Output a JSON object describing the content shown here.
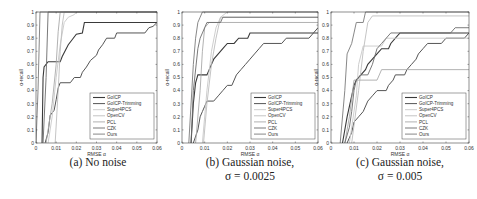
{
  "chart_data": [
    {
      "type": "line",
      "title": "(a) No noise",
      "caption_lines": [
        "(a) No noise"
      ],
      "xlabel": "RMSE α",
      "ylabel": "α-recall",
      "xlim": [
        0,
        0.06
      ],
      "ylim": [
        0,
        1
      ],
      "xticks": [
        "0",
        "0.01",
        "0.02",
        "0.03",
        "0.04",
        "0.05",
        "0.06"
      ],
      "yticks": [
        "0",
        "0.1",
        "0.2",
        "0.3",
        "0.4",
        "0.5",
        "0.6",
        "0.7",
        "0.8",
        "0.9",
        "1"
      ],
      "grid": false,
      "legend_position": "lower right",
      "series": [
        {
          "name": "GoICP",
          "color": "#3a3a3a",
          "width": 1.1,
          "points": [
            [
              0.003,
              0
            ],
            [
              0.0035,
              0.5
            ],
            [
              0.004,
              0.58
            ],
            [
              0.006,
              0.62
            ],
            [
              0.012,
              0.62
            ],
            [
              0.013,
              0.66
            ],
            [
              0.016,
              0.75
            ],
            [
              0.018,
              0.79
            ],
            [
              0.02,
              0.83
            ],
            [
              0.023,
              0.84
            ],
            [
              0.024,
              0.92
            ],
            [
              0.06,
              0.92
            ]
          ]
        },
        {
          "name": "GoICP-Trimming",
          "color": "#555555",
          "width": 1.0,
          "points": [
            [
              0.0045,
              0
            ],
            [
              0.006,
              0.08
            ],
            [
              0.007,
              0.21
            ],
            [
              0.009,
              0.25
            ],
            [
              0.01,
              0.33
            ],
            [
              0.011,
              0.42
            ],
            [
              0.012,
              0.46
            ],
            [
              0.017,
              0.46
            ],
            [
              0.019,
              0.5
            ],
            [
              0.022,
              0.5
            ],
            [
              0.023,
              0.54
            ],
            [
              0.025,
              0.58
            ],
            [
              0.027,
              0.63
            ],
            [
              0.03,
              0.67
            ],
            [
              0.031,
              0.71
            ],
            [
              0.033,
              0.75
            ],
            [
              0.035,
              0.8
            ],
            [
              0.039,
              0.8
            ],
            [
              0.04,
              0.84
            ],
            [
              0.054,
              0.84
            ],
            [
              0.056,
              0.88
            ],
            [
              0.058,
              0.89
            ],
            [
              0.06,
              0.92
            ]
          ]
        },
        {
          "name": "Super4PCS",
          "color": "#c8c8c8",
          "width": 0.9,
          "points": [
            [
              0.006,
              0
            ],
            [
              0.008,
              0.2
            ],
            [
              0.01,
              0.5
            ],
            [
              0.012,
              0.75
            ],
            [
              0.014,
              0.92
            ],
            [
              0.016,
              0.96
            ],
            [
              0.019,
              0.98
            ],
            [
              0.02,
              1
            ]
          ]
        },
        {
          "name": "OpenCV",
          "color": "#bdbdbd",
          "width": 0.9,
          "points": [
            [
              0.0095,
              0
            ],
            [
              0.011,
              0.4
            ],
            [
              0.012,
              0.7
            ],
            [
              0.013,
              0.9
            ],
            [
              0.014,
              1
            ]
          ]
        },
        {
          "name": "PCL",
          "color": "#a9a9a9",
          "width": 0.9,
          "points": [
            [
              0.005,
              0
            ],
            [
              0.008,
              0.3
            ],
            [
              0.01,
              0.6
            ],
            [
              0.011,
              0.85
            ],
            [
              0.012,
              1
            ]
          ]
        },
        {
          "name": "CZK",
          "color": "#6b6b6b",
          "width": 0.9,
          "points": [
            [
              0.0035,
              0
            ],
            [
              0.005,
              0.5
            ],
            [
              0.006,
              1
            ]
          ]
        },
        {
          "name": "Ours",
          "color": "#7a7a7a",
          "width": 0.9,
          "points": [
            [
              0,
              0
            ],
            [
              0.001,
              0.4
            ],
            [
              0.002,
              1
            ]
          ]
        }
      ]
    },
    {
      "type": "line",
      "title": "(b) Gaussian noise, σ = 0.0025",
      "caption_lines": [
        "(b) Gaussian noise,",
        "σ = 0.0025"
      ],
      "xlabel": "RMSE α",
      "ylabel": "α-recall",
      "xlim": [
        0,
        0.06
      ],
      "ylim": [
        0,
        1
      ],
      "xticks": [
        "0",
        "0.01",
        "0.02",
        "0.03",
        "0.04",
        "0.05",
        "0.06"
      ],
      "yticks": [
        "0",
        "0.1",
        "0.2",
        "0.3",
        "0.4",
        "0.5",
        "0.6",
        "0.7",
        "0.8",
        "0.9",
        "1"
      ],
      "grid": false,
      "legend_position": "lower right",
      "series": [
        {
          "name": "GoICP",
          "color": "#3a3a3a",
          "width": 1.1,
          "points": [
            [
              0.004,
              0
            ],
            [
              0.005,
              0.3
            ],
            [
              0.006,
              0.46
            ],
            [
              0.007,
              0.52
            ],
            [
              0.011,
              0.52
            ],
            [
              0.012,
              0.56
            ],
            [
              0.014,
              0.64
            ],
            [
              0.016,
              0.68
            ],
            [
              0.018,
              0.72
            ],
            [
              0.02,
              0.76
            ],
            [
              0.023,
              0.76
            ],
            [
              0.025,
              0.8
            ],
            [
              0.029,
              0.8
            ],
            [
              0.03,
              0.84
            ],
            [
              0.06,
              0.84
            ]
          ]
        },
        {
          "name": "GoICP-Trimming",
          "color": "#555555",
          "width": 1.0,
          "points": [
            [
              0.005,
              0
            ],
            [
              0.007,
              0.1
            ],
            [
              0.008,
              0.2
            ],
            [
              0.009,
              0.24
            ],
            [
              0.01,
              0.28
            ],
            [
              0.011,
              0.32
            ],
            [
              0.014,
              0.32
            ],
            [
              0.016,
              0.36
            ],
            [
              0.018,
              0.4
            ],
            [
              0.02,
              0.44
            ],
            [
              0.022,
              0.44
            ],
            [
              0.024,
              0.52
            ],
            [
              0.026,
              0.56
            ],
            [
              0.028,
              0.6
            ],
            [
              0.03,
              0.64
            ],
            [
              0.032,
              0.68
            ],
            [
              0.034,
              0.72
            ],
            [
              0.036,
              0.76
            ],
            [
              0.044,
              0.76
            ],
            [
              0.046,
              0.8
            ],
            [
              0.056,
              0.8
            ],
            [
              0.058,
              0.84
            ],
            [
              0.06,
              0.88
            ]
          ]
        },
        {
          "name": "Super4PCS",
          "color": "#c8c8c8",
          "width": 0.9,
          "points": [
            [
              0.009,
              0
            ],
            [
              0.011,
              0.4
            ],
            [
              0.013,
              0.7
            ],
            [
              0.015,
              0.88
            ],
            [
              0.017,
              0.96
            ],
            [
              0.02,
              1
            ]
          ]
        },
        {
          "name": "OpenCV",
          "color": "#bdbdbd",
          "width": 0.9,
          "points": [
            [
              0.0095,
              0
            ],
            [
              0.011,
              0.3
            ],
            [
              0.013,
              0.6
            ],
            [
              0.015,
              0.8
            ],
            [
              0.017,
              0.96
            ],
            [
              0.06,
              0.96
            ]
          ]
        },
        {
          "name": "PCL",
          "color": "#a9a9a9",
          "width": 0.9,
          "points": [
            [
              0.006,
              0
            ],
            [
              0.008,
              0.4
            ],
            [
              0.009,
              0.7
            ],
            [
              0.01,
              0.88
            ],
            [
              0.012,
              0.92
            ],
            [
              0.06,
              0.92
            ]
          ]
        },
        {
          "name": "CZK",
          "color": "#6b6b6b",
          "width": 0.9,
          "points": [
            [
              0.004,
              0
            ],
            [
              0.005,
              0.4
            ],
            [
              0.007,
              0.72
            ],
            [
              0.008,
              0.8
            ],
            [
              0.009,
              0.84
            ],
            [
              0.01,
              0.88
            ],
            [
              0.011,
              0.92
            ],
            [
              0.017,
              0.92
            ],
            [
              0.018,
              0.96
            ],
            [
              0.06,
              0.96
            ]
          ]
        },
        {
          "name": "Ours",
          "color": "#7a7a7a",
          "width": 0.9,
          "points": [
            [
              0.003,
              0
            ],
            [
              0.005,
              0.6
            ],
            [
              0.006,
              0.8
            ],
            [
              0.007,
              0.92
            ],
            [
              0.008,
              0.96
            ],
            [
              0.009,
              1
            ],
            [
              0.06,
              1
            ]
          ]
        }
      ]
    },
    {
      "type": "line",
      "title": "(c) Gaussian noise, σ = 0.005",
      "caption_lines": [
        "(c) Gaussian noise,",
        "σ = 0.005"
      ],
      "xlabel": "RMSE α",
      "ylabel": "α-recall",
      "xlim": [
        0,
        0.06
      ],
      "ylim": [
        0,
        1
      ],
      "xticks": [
        "0",
        "0.01",
        "0.02",
        "0.03",
        "0.04",
        "0.05",
        "0.06"
      ],
      "yticks": [
        "0",
        "0.1",
        "0.2",
        "0.3",
        "0.4",
        "0.5",
        "0.6",
        "0.7",
        "0.8",
        "0.9",
        "1"
      ],
      "grid": false,
      "legend_position": "lower right",
      "series": [
        {
          "name": "GoICP",
          "color": "#3a3a3a",
          "width": 1.1,
          "points": [
            [
              0.005,
              0
            ],
            [
              0.007,
              0.2
            ],
            [
              0.009,
              0.36
            ],
            [
              0.01,
              0.44
            ],
            [
              0.011,
              0.48
            ],
            [
              0.013,
              0.52
            ],
            [
              0.015,
              0.56
            ],
            [
              0.016,
              0.6
            ],
            [
              0.018,
              0.64
            ],
            [
              0.02,
              0.68
            ],
            [
              0.022,
              0.72
            ],
            [
              0.025,
              0.72
            ],
            [
              0.026,
              0.76
            ],
            [
              0.028,
              0.8
            ],
            [
              0.03,
              0.84
            ],
            [
              0.06,
              0.84
            ]
          ]
        },
        {
          "name": "GoICP-Trimming",
          "color": "#555555",
          "width": 1.0,
          "points": [
            [
              0.007,
              0
            ],
            [
              0.009,
              0.08
            ],
            [
              0.01,
              0.16
            ],
            [
              0.012,
              0.2
            ],
            [
              0.014,
              0.24
            ],
            [
              0.016,
              0.32
            ],
            [
              0.018,
              0.36
            ],
            [
              0.02,
              0.4
            ],
            [
              0.024,
              0.4
            ],
            [
              0.025,
              0.44
            ],
            [
              0.027,
              0.48
            ],
            [
              0.028,
              0.52
            ],
            [
              0.032,
              0.52
            ],
            [
              0.033,
              0.56
            ],
            [
              0.035,
              0.6
            ],
            [
              0.037,
              0.64
            ],
            [
              0.038,
              0.68
            ],
            [
              0.04,
              0.72
            ],
            [
              0.042,
              0.76
            ],
            [
              0.048,
              0.76
            ],
            [
              0.05,
              0.8
            ],
            [
              0.058,
              0.8
            ],
            [
              0.06,
              0.84
            ]
          ]
        },
        {
          "name": "Super4PCS",
          "color": "#c8c8c8",
          "width": 0.9,
          "points": [
            [
              0.008,
              0
            ],
            [
              0.011,
              0.36
            ],
            [
              0.012,
              0.6
            ],
            [
              0.014,
              0.74
            ],
            [
              0.022,
              0.74
            ],
            [
              0.024,
              0.8
            ],
            [
              0.06,
              0.8
            ]
          ]
        },
        {
          "name": "OpenCV",
          "color": "#bdbdbd",
          "width": 0.9,
          "points": [
            [
              0.009,
              0
            ],
            [
              0.012,
              0.4
            ],
            [
              0.014,
              0.7
            ],
            [
              0.016,
              0.92
            ],
            [
              0.018,
              0.97
            ],
            [
              0.06,
              0.97
            ]
          ]
        },
        {
          "name": "PCL",
          "color": "#a9a9a9",
          "width": 0.9,
          "points": [
            [
              0.006,
              0
            ],
            [
              0.008,
              0.2
            ],
            [
              0.01,
              0.48
            ],
            [
              0.02,
              0.48
            ],
            [
              0.022,
              0.56
            ],
            [
              0.06,
              0.56
            ]
          ]
        },
        {
          "name": "CZK",
          "color": "#6b6b6b",
          "width": 0.9,
          "points": [
            [
              0.006,
              0
            ],
            [
              0.008,
              0.12
            ],
            [
              0.009,
              0.24
            ],
            [
              0.01,
              0.4
            ],
            [
              0.011,
              0.48
            ],
            [
              0.013,
              0.52
            ],
            [
              0.016,
              0.52
            ],
            [
              0.018,
              0.6
            ],
            [
              0.02,
              0.72
            ],
            [
              0.022,
              0.76
            ],
            [
              0.024,
              0.8
            ],
            [
              0.026,
              0.84
            ],
            [
              0.04,
              0.84
            ],
            [
              0.052,
              0.84
            ],
            [
              0.054,
              0.88
            ],
            [
              0.06,
              0.88
            ]
          ]
        },
        {
          "name": "Ours",
          "color": "#7a7a7a",
          "width": 0.9,
          "points": [
            [
              0.004,
              0
            ],
            [
              0.006,
              0.4
            ],
            [
              0.007,
              0.68
            ],
            [
              0.009,
              0.76
            ],
            [
              0.01,
              0.84
            ],
            [
              0.011,
              0.92
            ],
            [
              0.014,
              0.92
            ],
            [
              0.015,
              1
            ],
            [
              0.06,
              1
            ]
          ]
        }
      ]
    }
  ]
}
